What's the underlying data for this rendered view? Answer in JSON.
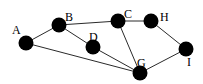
{
  "diagram": {
    "type": "graph",
    "node_radius": 7.5,
    "colors": {
      "node": "#000000",
      "edge": "#2a2a2a",
      "background": "#ffffff"
    },
    "nodes": [
      {
        "id": "A",
        "label": "A",
        "x": 26,
        "y": 43,
        "lx": 12,
        "ly": 34
      },
      {
        "id": "B",
        "label": "B",
        "x": 59,
        "y": 25,
        "lx": 65,
        "ly": 21
      },
      {
        "id": "D",
        "label": "D",
        "x": 93,
        "y": 47,
        "lx": 89,
        "ly": 41
      },
      {
        "id": "C",
        "label": "C",
        "x": 118,
        "y": 21,
        "lx": 124,
        "ly": 18
      },
      {
        "id": "H",
        "label": "H",
        "x": 151,
        "y": 21,
        "lx": 160,
        "ly": 21
      },
      {
        "id": "I",
        "label": "I",
        "x": 186,
        "y": 49,
        "lx": 187,
        "ly": 66
      },
      {
        "id": "G",
        "label": "G",
        "x": 140,
        "y": 73,
        "lx": 137,
        "ly": 67
      }
    ],
    "edges": [
      {
        "from": "A",
        "to": "B"
      },
      {
        "from": "A",
        "to": "G"
      },
      {
        "from": "B",
        "to": "C"
      },
      {
        "from": "B",
        "to": "D"
      },
      {
        "from": "D",
        "to": "G"
      },
      {
        "from": "C",
        "to": "G"
      },
      {
        "from": "C",
        "to": "H"
      },
      {
        "from": "H",
        "to": "I"
      },
      {
        "from": "I",
        "to": "G"
      }
    ]
  }
}
